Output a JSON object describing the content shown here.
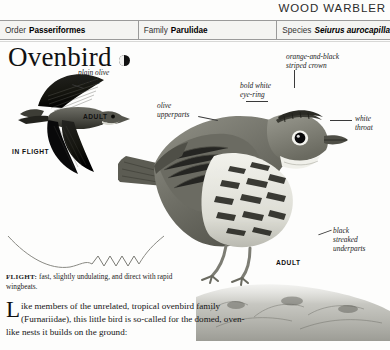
{
  "page": {
    "running_head": "WOOD WARBLER",
    "background": "#fdfdfc"
  },
  "taxonomy": {
    "order": {
      "key": "Order",
      "value": "Passeriformes"
    },
    "family": {
      "key": "Family",
      "value": "Parulidae"
    },
    "species": {
      "key": "Species",
      "value": "Seiurus aurocapilla"
    }
  },
  "title": {
    "name": "Ovenbird",
    "status_icon": "half-filled-circle-icon"
  },
  "plate": {
    "flight_bird": {
      "label": "plain olive\noverall",
      "adult_tag": "ADULT",
      "view_tag": "IN FLIGHT"
    },
    "perched_bird": {
      "adult_tag": "ADULT",
      "callouts": [
        {
          "name": "crown",
          "text": "orange-and-black\nstriped crown"
        },
        {
          "name": "eye-ring",
          "text": "bold white\neye-ring"
        },
        {
          "name": "upperparts",
          "text": "olive\nupperparts"
        },
        {
          "name": "throat",
          "text": "white\nthroat"
        },
        {
          "name": "underparts",
          "text": "black\nstreaked\nunderparts"
        }
      ]
    }
  },
  "flight_caption": {
    "label": "FLIGHT:",
    "text": " fast, slightly undulating, and direct with rapid wingbeats."
  },
  "body": {
    "dropcap": "L",
    "text": "ike members of the unrelated, tropical ovenbird family (Furnariidae), this little bird is so-called for the domed, oven-like nests it builds on the ground:"
  },
  "colors": {
    "rule": "#9a9a9a",
    "bar_bg": "#f4f4f2",
    "text": "#1a1a1a",
    "bird_dark": "#4a4a46",
    "bird_mid": "#8d8d86",
    "bird_light": "#cfcfc8"
  }
}
